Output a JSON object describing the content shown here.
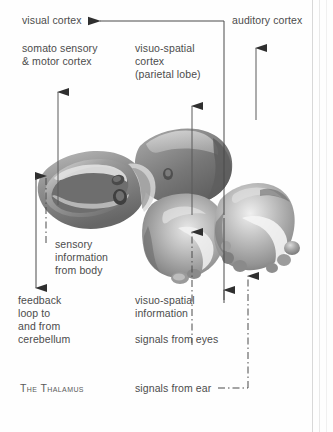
{
  "figure": {
    "caption": "The Thalamus",
    "text_color": "#4c4c4c",
    "line_color": "#3a3a3a",
    "background": "#ffffff"
  },
  "labels": {
    "visual_cortex": "visual cortex",
    "auditory_cortex": "auditory cortex",
    "somato_sensory_line1": "somato sensory",
    "somato_sensory_line2": "& motor cortex",
    "visuo_spatial_line1": "visuo-spatial",
    "visuo_spatial_line2": "cortex",
    "visuo_spatial_line3": "(parietal lobe)",
    "sensory_info_line1": "sensory",
    "sensory_info_line2": "information",
    "sensory_info_line3": "from body",
    "feedback_line1": "feedback",
    "feedback_line2": "loop to",
    "feedback_line3": "and from",
    "feedback_line4": "cerebellum",
    "visuo_spatial_info_line1": "visuo-spatial",
    "visuo_spatial_info_line2": "information",
    "signals_from_eyes": "signals from eyes",
    "signals_from_ear": "signals from ear",
    "the_thalamus": "The Thalamus"
  },
  "connectors": [
    {
      "name": "visual-cortex-feedback",
      "style": "solid",
      "direction": "leftward-arrow",
      "from": "visuo-spatial region riser at x=224",
      "to": "visual cortex label"
    },
    {
      "name": "somato-sensory-pathway",
      "style": "solid",
      "direction": "up-arrow",
      "to": "somato sensory & motor cortex"
    },
    {
      "name": "sensory-information-from-body",
      "style": "dash-dot",
      "direction": "down-arrow",
      "to": "thalamus body"
    },
    {
      "name": "feedback-loop-cerebellum",
      "style": "solid",
      "direction": "down-arrow",
      "to": "cerebellum"
    },
    {
      "name": "visuo-spatial-pathway",
      "style": "solid",
      "direction": "up-arrow",
      "to": "visuo-spatial cortex (parietal lobe)"
    },
    {
      "name": "visuo-spatial-information",
      "style": "dash-dot",
      "direction": "up-arrow",
      "to": "thalamus"
    },
    {
      "name": "signals-from-eyes",
      "style": "solid",
      "direction": "up-arrow",
      "to": "thalamus"
    },
    {
      "name": "signals-from-ear",
      "style": "dash-dot",
      "direction": "up-arrow",
      "to": "auditory cortex"
    }
  ]
}
